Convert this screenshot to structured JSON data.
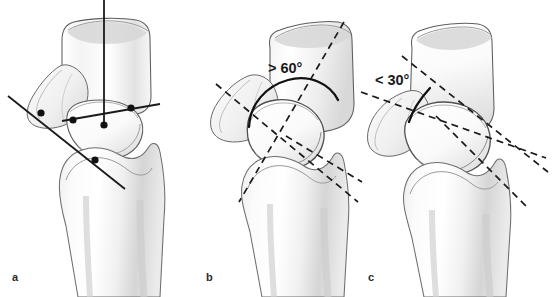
{
  "figure": {
    "background_color": "#ffffff",
    "width": 558,
    "height": 297,
    "line_color": "#1a1a1a",
    "bone_outline_color": "#595959",
    "bone_fill_light": "#fdfdfd",
    "bone_shadow_color": "#c9c9c9"
  },
  "panels": [
    {
      "id": "a",
      "label": "a",
      "label_x": 12,
      "label_y": 272,
      "caption": "Construction of radial, lunate and scaphoid reference axes with landmark points",
      "annotation": "",
      "line_style": "solid",
      "landmark_points": [
        {
          "name": "scaphoid-proximal-pole-point",
          "x": 41,
          "y": 113
        },
        {
          "name": "lunate-volar-horn-point",
          "x": 73,
          "y": 120
        },
        {
          "name": "lunate-center-point",
          "x": 104,
          "y": 125
        },
        {
          "name": "lunate-dorsal-horn-point",
          "x": 131,
          "y": 108
        },
        {
          "name": "radius-articular-point",
          "x": 95,
          "y": 160
        }
      ],
      "axes": [
        {
          "name": "radius-longitudinal-axis",
          "x1": 104,
          "y1": 0,
          "x2": 104,
          "y2": 126,
          "orientation": "vertical"
        },
        {
          "name": "lunate-transverse-axis",
          "x1": 62,
          "y1": 121,
          "x2": 160,
          "y2": 104,
          "orientation": "horizontal"
        },
        {
          "name": "scaphoid-longitudinal-axis",
          "x1": 8,
          "y1": 96,
          "x2": 125,
          "y2": 189,
          "orientation": "oblique"
        }
      ]
    },
    {
      "id": "b",
      "label": "b",
      "label_x": 206,
      "label_y": 272,
      "caption": "Dorsal intercalated segment instability: scapholunate angle greater than sixty degrees",
      "annotation": "> 60°",
      "annotation_x": 268,
      "annotation_y": 61,
      "annotation_value": 60,
      "annotation_comparator": ">",
      "annotation_unit": "°",
      "line_style": "dashed",
      "arc": {
        "name": "angle-arc-60",
        "sweep": "upper",
        "radius": 52
      },
      "axes": [
        {
          "name": "scaphoid-axis-dashed",
          "x1": 216,
          "y1": 84,
          "x2": 356,
          "y2": 200,
          "orientation": "oblique"
        },
        {
          "name": "lunate-axis-dashed",
          "x1": 342,
          "y1": 22,
          "x2": 240,
          "y2": 201,
          "orientation": "oblique"
        },
        {
          "name": "radius-axis-dashed",
          "x1": 288,
          "y1": 138,
          "x2": 360,
          "y2": 180,
          "orientation": "oblique"
        }
      ]
    },
    {
      "id": "c",
      "label": "c",
      "label_x": 368,
      "label_y": 272,
      "caption": "Volar intercalated segment instability: scapholunate angle less than thirty degrees",
      "annotation": "< 30°",
      "annotation_x": 375,
      "annotation_y": 73,
      "annotation_value": 30,
      "annotation_comparator": "<",
      "annotation_unit": "°",
      "line_style": "dashed",
      "arc": {
        "name": "angle-arc-30",
        "sweep": "narrow",
        "radius": 46
      },
      "axes": [
        {
          "name": "scaphoid-axis-dashed",
          "x1": 400,
          "y1": 57,
          "x2": 546,
          "y2": 170,
          "orientation": "oblique"
        },
        {
          "name": "lunate-axis-dashed",
          "x1": 363,
          "y1": 92,
          "x2": 543,
          "y2": 159,
          "orientation": "oblique"
        },
        {
          "name": "radius-axis-dashed",
          "x1": 438,
          "y1": 119,
          "x2": 528,
          "y2": 205,
          "orientation": "oblique"
        }
      ]
    }
  ]
}
